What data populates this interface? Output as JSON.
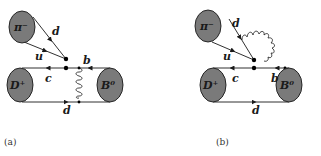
{
  "figure": {
    "panels": [
      {
        "caption": "(a)",
        "blobs": {
          "pion": "π⁻",
          "dmeson": "D⁺",
          "bmeson": "B⁰"
        },
        "quark_labels": {
          "pion_top": "d",
          "pion_bottom": "u",
          "upper_right": "b",
          "upper_left": "c",
          "lower": "d"
        },
        "gluon": "exchange between b line and spectator d line"
      },
      {
        "caption": "(b)",
        "blobs": {
          "pion": "π⁻",
          "dmeson": "D⁺",
          "bmeson": "B⁰"
        },
        "quark_labels": {
          "pion_top": "d",
          "pion_bottom": "u",
          "upper_right": "b",
          "upper_left": "c",
          "lower": "d"
        },
        "gluon": "emitted from b line absorbed by pion d quark"
      }
    ],
    "colors": {
      "blob_fill": "#7a7a7a",
      "line": "#1a1a1a",
      "background": "#ffffff"
    }
  }
}
